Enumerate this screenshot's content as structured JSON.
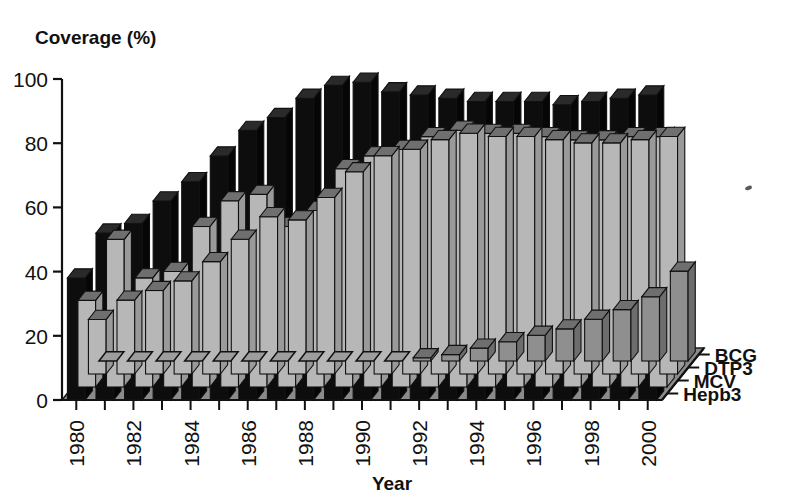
{
  "chart_data": {
    "type": "bar",
    "variant": "3d-grouped-rows",
    "title": "",
    "ylabel": "Coverage (%)",
    "xlabel": "Year",
    "ylim": [
      0,
      100
    ],
    "yticks": [
      0,
      20,
      40,
      60,
      80,
      100
    ],
    "ytick_labels": [
      "0",
      "20",
      "40",
      "60",
      "80",
      "100"
    ],
    "grid": false,
    "legend_position": "right-depth-axis",
    "categories": [
      "1980",
      "1981",
      "1982",
      "1983",
      "1984",
      "1985",
      "1986",
      "1987",
      "1988",
      "1989",
      "1990",
      "1991",
      "1992",
      "1993",
      "1994",
      "1995",
      "1996",
      "1997",
      "1998",
      "1999",
      "2000"
    ],
    "xtick_labels": [
      "1980",
      "1982",
      "1984",
      "1986",
      "1988",
      "1990",
      "1992",
      "1994",
      "1996",
      "1998",
      "2000"
    ],
    "xtick_label_every": 2,
    "series": [
      {
        "name": "BCG",
        "color": "#0d0d0d",
        "row": 0,
        "values": [
          38,
          52,
          55,
          62,
          68,
          76,
          84,
          88,
          94,
          98,
          99,
          96,
          95,
          94,
          93,
          93,
          93,
          92,
          93,
          94,
          95
        ]
      },
      {
        "name": "DTP3",
        "color": "#b7b7b7",
        "row": 1,
        "values": [
          27,
          46,
          34,
          36,
          50,
          58,
          60,
          50,
          55,
          68,
          72,
          74,
          78,
          80,
          79,
          79,
          78,
          77,
          77,
          78,
          78
        ]
      },
      {
        "name": "MCV",
        "color": "#b7b7b7",
        "row": 2,
        "values": [
          17,
          23,
          26,
          29,
          35,
          42,
          49,
          48,
          55,
          63,
          68,
          70,
          73,
          75,
          74,
          74,
          73,
          72,
          72,
          73,
          74
        ]
      },
      {
        "name": "Hepb3",
        "color": "#8f8f8f",
        "row": 3,
        "values": [
          0,
          0,
          0,
          0,
          0,
          0,
          0,
          0,
          0,
          0,
          0,
          1,
          2,
          4,
          6,
          8,
          10,
          13,
          16,
          20,
          28
        ]
      }
    ]
  },
  "palette": {
    "background": "#ffffff",
    "floor": "#8a8a8a",
    "floor_edge": "#1a1a1a",
    "bar_front": "#b7b7b7",
    "bar_side": "#9a9a9a",
    "bar_top": "#6f6f6f",
    "bar_back_row": "#0d0d0d",
    "bar_hepb_front": "#8f8f8f",
    "axis": "#111111",
    "text": "#111111"
  }
}
